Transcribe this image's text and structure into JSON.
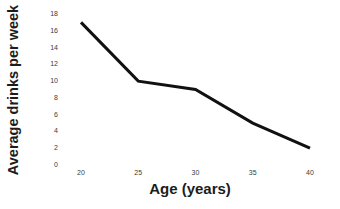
{
  "chart_data": {
    "type": "line",
    "title": "",
    "xlabel": "Age (years)",
    "ylabel": "Average drinks per week",
    "x": [
      20,
      25,
      30,
      35,
      40
    ],
    "values": [
      17,
      10,
      9,
      5,
      2
    ],
    "series": [
      {
        "name": "Average drinks per week",
        "values": [
          17,
          10,
          9,
          5,
          2
        ],
        "color": "#111111"
      }
    ],
    "xlim": [
      20,
      40
    ],
    "ylim": [
      0,
      18
    ],
    "x_ticks": [
      "20",
      "25",
      "30",
      "35",
      "40"
    ],
    "y_ticks": [
      "18",
      "16",
      "14",
      "12",
      "10",
      "8",
      "6",
      "4",
      "2",
      "0"
    ],
    "x_tick_values": [
      20,
      25,
      30,
      35,
      40
    ],
    "y_tick_values": [
      18,
      16,
      14,
      12,
      10,
      8,
      6,
      4,
      2,
      0
    ],
    "grid": false,
    "legend": "none",
    "markers": false,
    "line_width": 3,
    "background_color": "#ffffff",
    "axis_label_color": "#1c1c1c",
    "tick_label_color": "#3b3b3b"
  }
}
